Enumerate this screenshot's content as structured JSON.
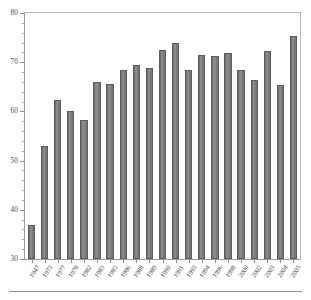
{
  "chart_data": {
    "type": "bar",
    "title": "",
    "subtitle": "",
    "xlabel": "",
    "ylabel": "",
    "ylim": [
      30,
      80
    ],
    "y_ticks": [
      30,
      40,
      50,
      60,
      70,
      80
    ],
    "y_minor_tick_step": 2,
    "grid": false,
    "legend": null,
    "legend_position": "none",
    "bar_color": "#818181",
    "bar_edge_color": "#5d5d5d",
    "axis_color": "#8e8e8e",
    "categories": [
      "1947",
      "1973",
      "1977",
      "1978",
      "1982",
      "1983",
      "1985",
      "1986",
      "1988",
      "1989",
      "1990",
      "1991",
      "1993",
      "1994",
      "1996",
      "1998",
      "2000",
      "2002",
      "2003",
      "2004",
      "2005"
    ],
    "values": [
      37.0,
      53.0,
      62.3,
      60.1,
      58.3,
      66.0,
      65.6,
      68.4,
      69.5,
      68.9,
      72.4,
      74.0,
      68.4,
      71.5,
      71.2,
      71.8,
      68.4,
      66.3,
      72.3,
      65.3,
      75.4
    ],
    "series": [
      {
        "name": "",
        "values": [
          37.0,
          53.0,
          62.3,
          60.1,
          58.3,
          66.0,
          65.6,
          68.4,
          69.5,
          68.9,
          72.4,
          74.0,
          68.4,
          71.5,
          71.2,
          71.8,
          68.4,
          66.3,
          72.3,
          65.3,
          75.4
        ]
      }
    ]
  },
  "figure": {
    "top_mark": "",
    "footer_rule_present": true
  }
}
